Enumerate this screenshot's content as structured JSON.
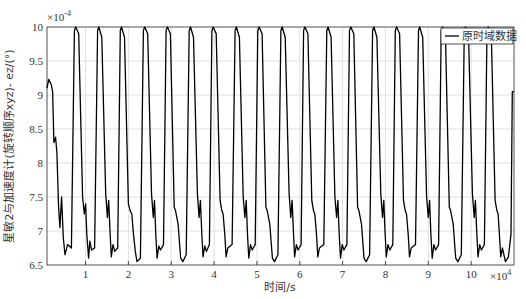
{
  "chart_data": {
    "type": "line",
    "title": "",
    "xlabel": "时间/s",
    "ylabel": "星敏2与加速度计(旋转顺序xyz)- ez/(°)",
    "x_multiplier": "×10^4",
    "y_multiplier": "×10^-4",
    "xlim": [
      0.1,
      11.0
    ],
    "ylim": [
      6.5,
      10
    ],
    "xticks": [
      1,
      2,
      3,
      4,
      5,
      6,
      7,
      8,
      9,
      10
    ],
    "yticks": [
      6.5,
      7,
      7.5,
      8,
      8.5,
      9,
      9.5,
      10
    ],
    "ytick_labels": [
      "6.5",
      "7",
      "7.5",
      "8",
      "8.5",
      "9",
      "9.5",
      "10"
    ],
    "xtick_labels": [
      "1",
      "2",
      "3",
      "4",
      "5",
      "6",
      "7",
      "8",
      "9",
      "10"
    ],
    "grid": true,
    "legend": {
      "position": "upper right",
      "entries": [
        "原时域数据"
      ]
    },
    "series": [
      {
        "name": "原时域数据",
        "color": "#000000",
        "x": [
          0.1,
          0.14,
          0.2,
          0.23,
          0.26,
          0.3,
          0.33,
          0.37,
          0.4,
          0.44,
          0.48,
          0.52,
          0.58,
          0.67,
          0.74,
          0.77,
          0.84,
          0.93,
          0.97,
          1.0,
          1.03,
          1.07,
          1.1,
          1.14,
          1.21,
          1.28,
          1.31,
          1.38,
          1.47,
          1.51,
          1.54,
          1.57,
          1.6,
          1.64,
          1.68,
          1.75,
          1.81,
          1.84,
          1.91,
          2.0,
          2.04,
          2.08,
          2.12,
          2.16,
          2.2,
          2.28,
          2.35,
          2.38,
          2.45,
          2.54,
          2.58,
          2.61,
          2.64,
          2.67,
          2.71,
          2.75,
          2.82,
          2.88,
          2.91,
          2.98,
          3.07,
          3.1,
          3.16,
          3.22,
          3.27,
          3.35,
          3.42,
          3.45,
          3.52,
          3.61,
          3.65,
          3.68,
          3.71,
          3.74,
          3.78,
          3.82,
          3.89,
          3.95,
          3.98,
          4.05,
          4.14,
          4.18,
          4.21,
          4.25,
          4.28,
          4.32,
          4.42,
          4.49,
          4.52,
          4.59,
          4.68,
          4.72,
          4.75,
          4.78,
          4.81,
          4.85,
          4.89,
          4.96,
          5.02,
          5.05,
          5.12,
          5.21,
          5.24,
          5.3,
          5.36,
          5.41,
          5.49,
          5.56,
          5.59,
          5.66,
          5.75,
          5.79,
          5.82,
          5.85,
          5.88,
          5.92,
          5.96,
          6.03,
          6.09,
          6.12,
          6.19,
          6.28,
          6.32,
          6.35,
          6.39,
          6.42,
          6.46,
          6.56,
          6.63,
          6.66,
          6.73,
          6.82,
          6.86,
          6.89,
          6.92,
          6.95,
          6.99,
          7.03,
          7.1,
          7.16,
          7.19,
          7.26,
          7.35,
          7.38,
          7.44,
          7.5,
          7.55,
          7.63,
          7.7,
          7.73,
          7.8,
          7.89,
          7.93,
          7.96,
          7.99,
          8.02,
          8.06,
          8.1,
          8.17,
          8.23,
          8.26,
          8.33,
          8.42,
          8.46,
          8.49,
          8.53,
          8.56,
          8.6,
          8.7,
          8.77,
          8.8,
          8.87,
          8.96,
          9.0,
          9.03,
          9.06,
          9.09,
          9.13,
          9.17,
          9.24,
          9.3,
          9.33,
          9.4,
          9.49,
          9.52,
          9.58,
          9.64,
          9.69,
          9.77,
          9.84,
          9.87,
          9.94,
          10.03,
          10.07,
          10.1,
          10.13,
          10.16,
          10.2,
          10.24,
          10.31,
          10.37,
          10.4,
          10.47,
          10.56,
          10.6,
          10.63,
          10.66,
          10.69,
          10.73,
          10.8,
          10.87,
          10.93,
          10.96,
          11.0
        ],
        "y": [
          9.1,
          9.23,
          9.15,
          9.05,
          8.3,
          8.38,
          8.15,
          7.35,
          7.05,
          7.5,
          6.9,
          6.65,
          6.8,
          6.75,
          9.95,
          10.0,
          9.9,
          7.5,
          7.25,
          7.4,
          6.95,
          6.6,
          6.85,
          6.72,
          6.75,
          9.95,
          10.0,
          9.85,
          7.55,
          7.2,
          7.45,
          7.0,
          6.62,
          6.8,
          6.7,
          6.75,
          9.95,
          10.0,
          9.85,
          7.4,
          7.3,
          7.25,
          6.95,
          6.7,
          6.55,
          6.6,
          9.95,
          10.0,
          9.9,
          7.55,
          7.2,
          7.45,
          6.95,
          6.6,
          6.78,
          6.72,
          6.8,
          9.95,
          10.0,
          9.9,
          7.35,
          7.3,
          7.1,
          6.6,
          6.55,
          6.65,
          9.95,
          10.0,
          9.85,
          7.55,
          7.2,
          7.45,
          7.0,
          6.62,
          6.78,
          6.7,
          6.8,
          9.95,
          10.0,
          9.9,
          7.45,
          7.3,
          7.25,
          6.95,
          6.62,
          6.75,
          6.8,
          9.95,
          10.0,
          9.85,
          7.5,
          7.2,
          7.45,
          6.95,
          6.6,
          6.8,
          6.72,
          6.8,
          9.95,
          10.0,
          9.9,
          7.35,
          7.3,
          7.1,
          6.6,
          6.55,
          6.65,
          9.95,
          10.0,
          9.85,
          7.55,
          7.2,
          7.45,
          7.0,
          6.62,
          6.8,
          6.72,
          6.8,
          9.95,
          10.0,
          9.9,
          7.45,
          7.3,
          7.25,
          6.95,
          6.62,
          6.75,
          6.8,
          9.95,
          10.0,
          9.85,
          7.5,
          7.2,
          7.45,
          6.95,
          6.6,
          6.8,
          6.72,
          6.8,
          9.95,
          10.0,
          9.9,
          7.35,
          7.3,
          7.1,
          6.6,
          6.55,
          6.65,
          9.95,
          10.0,
          9.85,
          7.55,
          7.2,
          7.45,
          7.0,
          6.62,
          6.8,
          6.72,
          6.8,
          9.95,
          10.0,
          9.9,
          7.45,
          7.3,
          7.25,
          6.95,
          6.62,
          6.75,
          6.8,
          9.95,
          10.0,
          9.85,
          7.5,
          7.2,
          7.45,
          6.95,
          6.6,
          6.8,
          6.72,
          6.8,
          9.95,
          10.0,
          9.9,
          7.35,
          7.3,
          7.1,
          6.6,
          6.55,
          6.65,
          9.95,
          10.0,
          9.85,
          7.55,
          7.2,
          7.45,
          7.0,
          6.62,
          6.8,
          6.72,
          6.8,
          9.95,
          10.0,
          9.9,
          7.45,
          7.3,
          7.25,
          6.95,
          6.62,
          6.75,
          6.55,
          6.62,
          6.95,
          9.05,
          9.05
        ]
      }
    ]
  }
}
